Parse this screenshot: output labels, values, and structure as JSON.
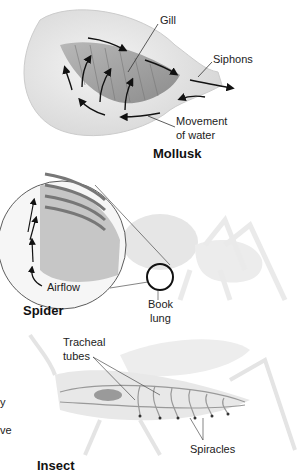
{
  "mollusk": {
    "title": "Mollusk",
    "labels": {
      "gill": "Gill",
      "siphons": "Siphons",
      "movement1": "Movement",
      "movement2": "of water"
    }
  },
  "spider": {
    "title": "Spider",
    "labels": {
      "airflow": "Airflow",
      "book1": "Book",
      "book2": "lung"
    }
  },
  "insect": {
    "title": "Insect",
    "labels": {
      "tracheal1": "Tracheal",
      "tracheal2": "tubes",
      "spiracles": "Spiracles"
    }
  },
  "edge_fragments": [
    "y",
    "ve"
  ]
}
